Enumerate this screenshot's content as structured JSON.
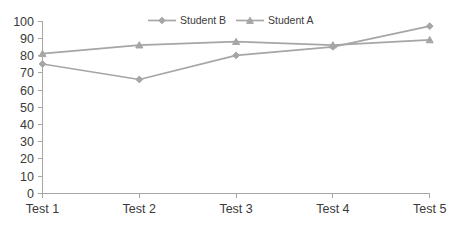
{
  "chart_data": {
    "type": "line",
    "title": "",
    "xlabel": "",
    "ylabel": "",
    "categories": [
      "Test 1",
      "Test 2",
      "Test 3",
      "Test 4",
      "Test 5"
    ],
    "ylim": [
      0,
      100
    ],
    "ytick_step": 10,
    "yticks": [
      0,
      10,
      20,
      30,
      40,
      50,
      60,
      70,
      80,
      90,
      100
    ],
    "grid": false,
    "legend_position": "top-center",
    "series": [
      {
        "name": "Student B",
        "values": [
          75,
          66,
          80,
          85,
          97
        ],
        "color": "#a6a6a6",
        "marker": "diamond"
      },
      {
        "name": "Student A",
        "values": [
          81,
          86,
          88,
          86,
          89
        ],
        "color": "#a6a6a6",
        "marker": "triangle"
      }
    ]
  },
  "legend": {
    "entries": [
      {
        "label": "Student B"
      },
      {
        "label": "Student A"
      }
    ]
  },
  "axes": {
    "y_labels": [
      "100",
      "90",
      "80",
      "70",
      "60",
      "50",
      "40",
      "30",
      "20",
      "10",
      "0"
    ],
    "x_labels": [
      "Test 1",
      "Test 2",
      "Test 3",
      "Test 4",
      "Test 5"
    ]
  },
  "colors": {
    "series_grey": "#a6a6a6",
    "axis_grey": "#a6a6a6",
    "text_grey": "#3a3a3a",
    "background": "#ffffff"
  }
}
